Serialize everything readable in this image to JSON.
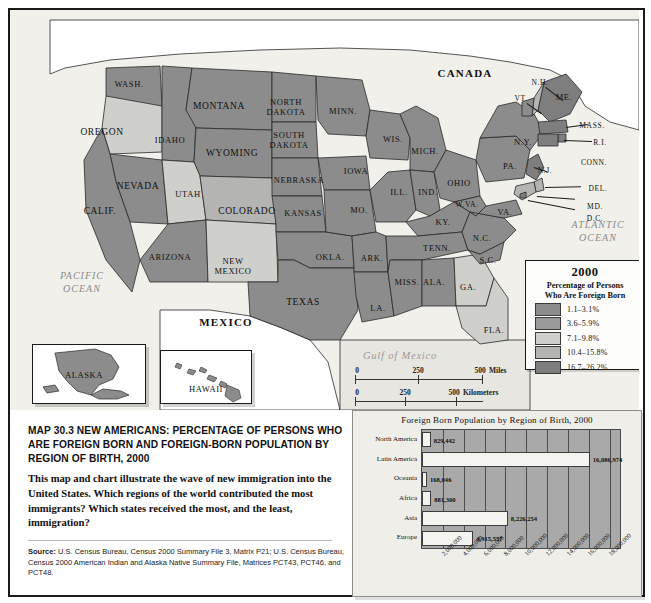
{
  "map": {
    "countries": [
      {
        "name": "CANADA",
        "x": 455,
        "y": 63
      },
      {
        "name": "MEXICO",
        "x": 216,
        "y": 312
      }
    ],
    "oceans": [
      {
        "name": "PACIFIC\nOCEAN",
        "x": 72,
        "y": 272
      },
      {
        "name": "ATLANTIC\nOCEAN",
        "x": 588,
        "y": 221
      },
      {
        "name": "Gulf of Mexico",
        "x": 390,
        "y": 345
      }
    ],
    "states": [
      {
        "label": "WASH.",
        "x": 119,
        "y": 74
      },
      {
        "label": "OREGON",
        "x": 92,
        "y": 122
      },
      {
        "label": "IDAHO",
        "x": 160,
        "y": 130
      },
      {
        "label": "MONTANA",
        "x": 209,
        "y": 96
      },
      {
        "label": "WYOMING",
        "x": 222,
        "y": 143
      },
      {
        "label": "NEVADA",
        "x": 128,
        "y": 176
      },
      {
        "label": "CALIF.",
        "x": 90,
        "y": 201
      },
      {
        "label": "UTAH",
        "x": 178,
        "y": 184
      },
      {
        "label": "COLORADO",
        "x": 237,
        "y": 201
      },
      {
        "label": "ARIZONA",
        "x": 160,
        "y": 247
      },
      {
        "label": "NEW\nMEXICO",
        "x": 223,
        "y": 256
      },
      {
        "label": "NORTH\nDAKOTA",
        "x": 276,
        "y": 97
      },
      {
        "label": "SOUTH\nDAKOTA",
        "x": 279,
        "y": 130
      },
      {
        "label": "NEBRASKA",
        "x": 289,
        "y": 170
      },
      {
        "label": "KANSAS",
        "x": 293,
        "y": 203
      },
      {
        "label": "OKLA.",
        "x": 320,
        "y": 247
      },
      {
        "label": "TEXAS",
        "x": 293,
        "y": 292
      },
      {
        "label": "MINN.",
        "x": 333,
        "y": 101
      },
      {
        "label": "IOWA",
        "x": 346,
        "y": 161
      },
      {
        "label": "MO.",
        "x": 349,
        "y": 200
      },
      {
        "label": "ARK.",
        "x": 362,
        "y": 248
      },
      {
        "label": "LA.",
        "x": 368,
        "y": 298
      },
      {
        "label": "WIS.",
        "x": 383,
        "y": 129
      },
      {
        "label": "ILL.",
        "x": 389,
        "y": 182
      },
      {
        "label": "MICH.",
        "x": 415,
        "y": 141
      },
      {
        "label": "IND.",
        "x": 418,
        "y": 182
      },
      {
        "label": "OHIO",
        "x": 449,
        "y": 173
      },
      {
        "label": "KY.",
        "x": 433,
        "y": 212
      },
      {
        "label": "TENN.",
        "x": 427,
        "y": 238
      },
      {
        "label": "MISS.",
        "x": 397,
        "y": 272
      },
      {
        "label": "ALA.",
        "x": 424,
        "y": 272
      },
      {
        "label": "GA.",
        "x": 458,
        "y": 277
      },
      {
        "label": "FLA.",
        "x": 484,
        "y": 320
      },
      {
        "label": "S.C.",
        "x": 478,
        "y": 250
      },
      {
        "label": "N.C.",
        "x": 472,
        "y": 228
      },
      {
        "label": "W.VA.",
        "x": 457,
        "y": 194
      },
      {
        "label": "VA.",
        "x": 495,
        "y": 202
      },
      {
        "label": "PA.",
        "x": 500,
        "y": 156
      },
      {
        "label": "N.Y.",
        "x": 513,
        "y": 132
      },
      {
        "label": "ME.",
        "x": 554,
        "y": 87
      },
      {
        "label": "VT.",
        "x": 511,
        "y": 88
      },
      {
        "label": "N.H.",
        "x": 530,
        "y": 72
      },
      {
        "label": "MASS.",
        "x": 582,
        "y": 115
      },
      {
        "label": "R.I.",
        "x": 590,
        "y": 132
      },
      {
        "label": "CONN.",
        "x": 584,
        "y": 152
      },
      {
        "label": "N.J.",
        "x": 535,
        "y": 160
      },
      {
        "label": "DEL.",
        "x": 588,
        "y": 178
      },
      {
        "label": "MD.",
        "x": 585,
        "y": 196
      },
      {
        "label": "D.C.",
        "x": 585,
        "y": 208
      }
    ],
    "insets": [
      {
        "label": "ALASKA",
        "x": 74,
        "y": 365
      },
      {
        "label": "HAWAII",
        "x": 196,
        "y": 379
      }
    ],
    "scales": [
      {
        "unit": "Miles",
        "ticks": [
          "0",
          "250",
          "500"
        ]
      },
      {
        "unit": "Kilometers",
        "ticks": [
          "0",
          "250",
          "500"
        ]
      }
    ]
  },
  "legend": {
    "year": "2000",
    "subtitle_line1": "Percentage of Persons",
    "subtitle_line2": "Who Are Foreign Born",
    "entries": [
      {
        "label": "1.1–3.1%",
        "color": "#8c8c8c"
      },
      {
        "label": "3.6–5.9%",
        "color": "#9a9a9a"
      },
      {
        "label": "7.1–9.8%",
        "color": "#cfcfcb"
      },
      {
        "label": "10.4–15.8%",
        "color": "#b4b4b2"
      },
      {
        "label": "16.7–26.2%",
        "color": "#7e7e7e"
      }
    ]
  },
  "caption": {
    "title": "MAP 30.3   NEW AMERICANS: PERCENTAGE OF PERSONS WHO ARE FOREIGN BORN AND FOREIGN-BORN POPULATION BY REGION OF BIRTH, 2000",
    "body": "This map and chart illustrate the wave of new immigration into the United States. Which regions of the world contributed the most immigrants? Which states received the most, and the least, immigration?",
    "source_label": "Source:",
    "source_text": " U.S. Census Bureau, Census 2000 Summary File 3, Matrix P21; U.S. Census Bureau, Census 2000 American Indian and Alaska Native Summary File, Matrices PCT43, PCT46, and PCT48."
  },
  "chart_data": {
    "type": "bar",
    "orientation": "horizontal",
    "title": "Foreign Born Population by Region of Birth, 2000",
    "xlabel": "",
    "ylabel": "",
    "xlim": [
      0,
      19000000
    ],
    "grid": true,
    "legend": "none",
    "categories": [
      "North America",
      "Latin America",
      "Oceania",
      "Africa",
      "Asia",
      "Europe"
    ],
    "values": [
      829442,
      16086974,
      168046,
      881300,
      8226254,
      4915557
    ],
    "value_labels": [
      "829,442",
      "16,086,974",
      "168,046",
      "881,300",
      "8,226,254",
      "4,915,557"
    ],
    "xticks": [
      2000000,
      4000000,
      6000000,
      8000000,
      10000000,
      12000000,
      14000000,
      16000000,
      18000000
    ],
    "xticklabels": [
      "2,000,000",
      "4,000,000",
      "6,000,000",
      "8,000,000",
      "10,000,000",
      "12,000,000",
      "14,000,000",
      "16,000,000",
      "18,000,000"
    ]
  }
}
